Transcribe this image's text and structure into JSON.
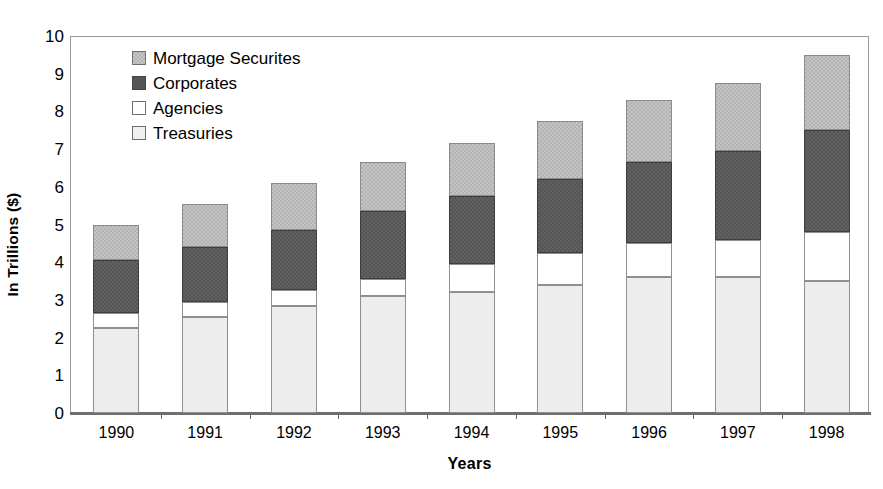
{
  "chart_data": {
    "type": "bar",
    "subtype": "stacked-bar",
    "title": "",
    "xlabel": "Years",
    "ylabel": "In Trillions ($)",
    "categories": [
      "1990",
      "1991",
      "1992",
      "1993",
      "1994",
      "1995",
      "1996",
      "1997",
      "1998"
    ],
    "ylim": [
      0,
      10
    ],
    "ytick_labels": [
      "10",
      "9",
      "8",
      "7",
      "6",
      "5",
      "4",
      "3",
      "2",
      "1",
      "0"
    ],
    "ytick_values": [
      10,
      9,
      8,
      7,
      6,
      5,
      4,
      3,
      2,
      1,
      0
    ],
    "grid": false,
    "legend_position": "top-left-inside",
    "series": [
      {
        "name": "Treasuries",
        "color": "#ededed",
        "values": [
          2.25,
          2.55,
          2.85,
          3.1,
          3.2,
          3.4,
          3.6,
          3.6,
          3.5
        ]
      },
      {
        "name": "Agencies",
        "color": "#ffffff",
        "values": [
          0.4,
          0.4,
          0.4,
          0.45,
          0.75,
          0.85,
          0.9,
          1.0,
          1.3
        ]
      },
      {
        "name": "Corporates",
        "color": "#555555",
        "values": [
          1.4,
          1.45,
          1.6,
          1.8,
          1.8,
          1.95,
          2.15,
          2.35,
          2.7
        ]
      },
      {
        "name": "Mortgage Securites",
        "color": "#b3b3b3",
        "values": [
          0.95,
          1.15,
          1.25,
          1.3,
          1.4,
          1.55,
          1.65,
          1.8,
          2.0
        ]
      }
    ],
    "totals": [
      5.0,
      5.55,
      6.1,
      6.65,
      7.15,
      7.75,
      8.3,
      8.75,
      9.5
    ]
  },
  "legend": {
    "items": [
      {
        "label": "Mortgage Securites",
        "swatch": "mortgage-swatch"
      },
      {
        "label": "Corporates",
        "swatch": "corporates-swatch"
      },
      {
        "label": "Agencies",
        "swatch": "agencies-swatch"
      },
      {
        "label": "Treasuries",
        "swatch": "treasuries-swatch"
      }
    ]
  },
  "axes": {
    "y_title": "In Trillions ($)",
    "x_title": "Years"
  }
}
